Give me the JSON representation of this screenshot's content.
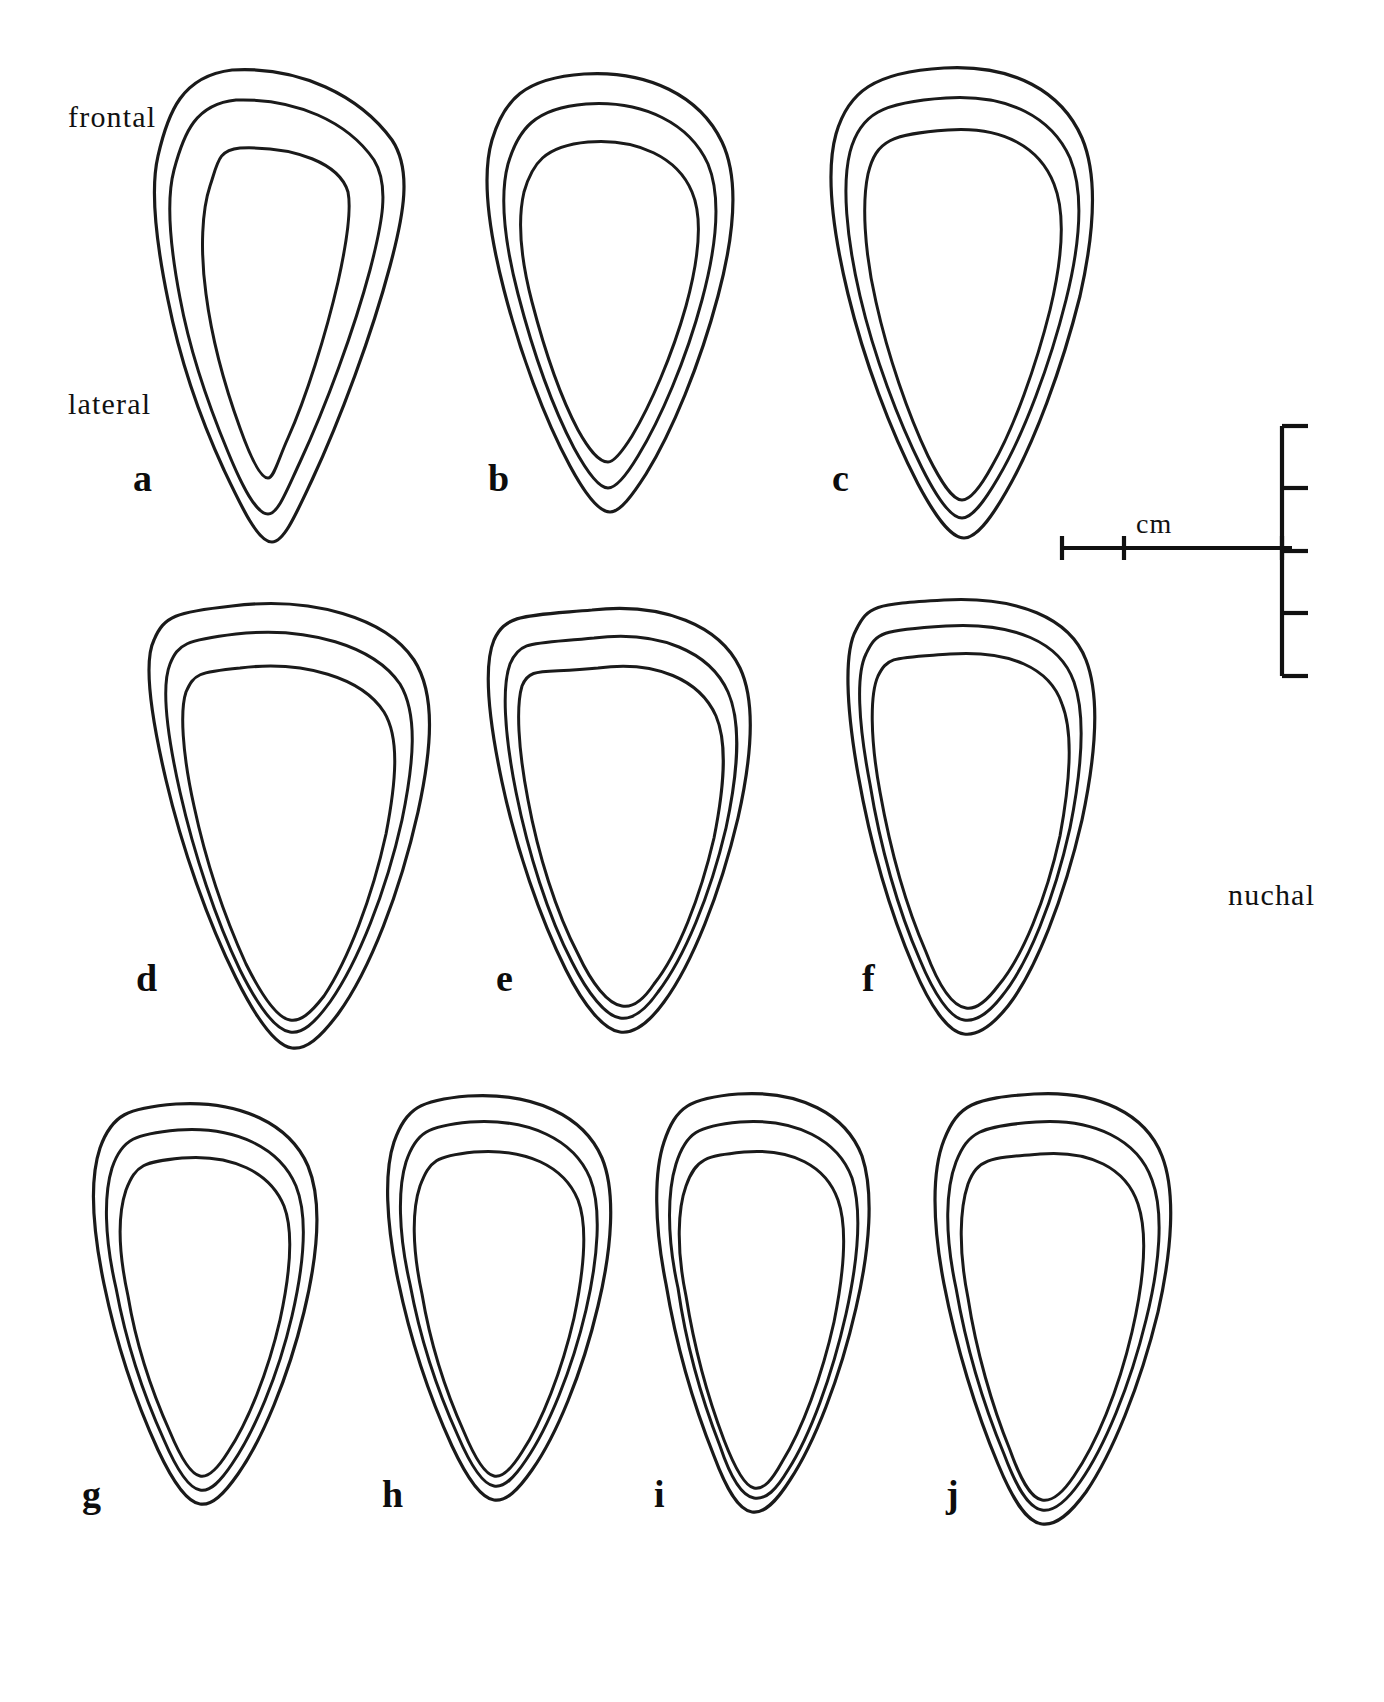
{
  "figure": {
    "type": "line-drawing",
    "background_color": "#ffffff",
    "line_color": "#1a1a1a"
  },
  "orientation_labels": [
    {
      "id": "frontal",
      "text": "frontal",
      "x": 68,
      "y": 100
    },
    {
      "id": "lateral",
      "text": "lateral",
      "x": 68,
      "y": 387
    },
    {
      "id": "nuchal",
      "text": "nuchal",
      "x": 1228,
      "y": 878
    }
  ],
  "scale_bar": {
    "unit_label": "cm",
    "unit_label_x": 1136,
    "unit_label_y": 508,
    "orientation": "cross",
    "vertical": {
      "x": 1282,
      "y_top": 426,
      "y_bottom": 676,
      "tick_length": 26,
      "ticks_y": [
        426,
        488,
        551,
        613,
        676
      ]
    },
    "horizontal": {
      "y": 548,
      "x_left": 1062,
      "x_right": 1292,
      "tick_height": 24,
      "ticks_x": [
        1062,
        1124,
        1282
      ]
    }
  },
  "panels": [
    {
      "label": "a",
      "label_x": 133,
      "label_y": 456,
      "row": 1,
      "col": 1
    },
    {
      "label": "b",
      "label_x": 488,
      "label_y": 456,
      "row": 1,
      "col": 2
    },
    {
      "label": "c",
      "label_x": 832,
      "label_y": 456,
      "row": 1,
      "col": 3
    },
    {
      "label": "d",
      "label_x": 136,
      "label_y": 956,
      "row": 2,
      "col": 1
    },
    {
      "label": "e",
      "label_x": 496,
      "label_y": 956,
      "row": 2,
      "col": 2
    },
    {
      "label": "f",
      "label_x": 862,
      "label_y": 956,
      "row": 2,
      "col": 3
    },
    {
      "label": "g",
      "label_x": 82,
      "label_y": 1472,
      "row": 3,
      "col": 1
    },
    {
      "label": "h",
      "label_x": 382,
      "label_y": 1472,
      "row": 3,
      "col": 2
    },
    {
      "label": "i",
      "label_x": 654,
      "label_y": 1472,
      "row": 3,
      "col": 3
    },
    {
      "label": "j",
      "label_x": 946,
      "label_y": 1472,
      "row": 3,
      "col": 4
    }
  ],
  "shapes": {
    "a": {
      "outer": "M 232 70 C 300 66 360 96 392 140 C 412 170 404 214 390 266 C 372 334 340 420 312 480 C 296 514 284 542 272 542 C 258 542 242 508 224 470 C 200 418 180 360 168 300 C 156 242 150 190 158 156 C 168 112 182 76 232 70 Z",
      "mid": "M 236 100 C 296 98 348 122 374 160 C 390 186 382 224 370 270 C 354 330 326 406 300 462 C 286 492 278 514 268 514 C 256 514 242 486 228 452 C 208 404 190 352 180 298 C 170 246 166 200 174 170 C 184 132 196 104 236 100 Z",
      "inner": "M 240 148 C 296 146 340 164 348 192 C 352 212 346 246 338 282 C 326 334 306 398 288 438 C 278 460 274 478 268 478 C 260 478 250 456 240 428 C 224 384 212 340 206 294 C 200 250 202 210 210 186 C 218 162 218 150 240 148 Z"
    },
    "b": {
      "outer": "M 584 74 C 648 70 700 96 722 142 C 740 180 734 236 718 296 C 700 364 672 432 646 474 C 632 496 620 512 610 512 C 598 512 584 492 570 466 C 544 418 520 352 504 290 C 488 228 482 174 492 140 C 504 100 524 78 584 74 Z",
      "mid": "M 586 104 C 644 100 690 124 708 164 C 722 198 716 248 702 300 C 686 360 660 420 638 456 C 626 476 616 488 608 488 C 598 488 586 470 574 448 C 552 406 532 348 518 294 C 504 240 500 194 508 164 C 518 130 534 108 586 104 Z",
      "inner": "M 588 142 C 638 138 678 158 692 192 C 704 220 698 262 686 306 C 672 356 650 406 632 436 C 622 452 614 462 608 462 C 598 462 588 448 578 430 C 560 396 544 348 532 302 C 520 256 518 218 524 192 C 532 164 544 146 588 142 Z"
    },
    "c": {
      "outer": "M 944 68 C 1014 64 1062 92 1082 138 C 1098 176 1094 234 1080 296 C 1062 368 1034 444 1006 492 C 990 520 976 538 964 538 C 950 538 934 514 918 484 C 890 430 864 360 848 294 C 832 228 826 170 836 134 C 848 92 874 72 944 68 Z",
      "mid": "M 946 98 C 1010 94 1052 118 1070 158 C 1084 192 1080 244 1066 300 C 1050 364 1024 434 998 478 C 984 502 972 518 962 518 C 950 518 936 496 922 468 C 898 420 874 356 860 296 C 846 236 842 184 850 152 C 860 114 882 102 946 98 Z",
      "inner": "M 948 130 C 1004 126 1040 148 1054 184 C 1066 214 1062 260 1050 310 C 1036 366 1014 428 992 466 C 980 488 970 500 962 500 C 952 500 940 480 928 456 C 908 414 888 356 876 302 C 864 250 862 202 868 174 C 876 140 892 134 948 130 Z"
    },
    "d": {
      "outer": "M 232 606 C 312 596 386 618 414 660 C 436 694 432 748 418 812 C 400 892 370 970 338 1014 C 320 1038 306 1050 292 1048 C 276 1046 256 1018 236 978 C 208 922 182 848 166 780 C 150 712 144 660 154 640 C 164 616 176 612 232 606 Z",
      "mid": "M 236 634 C 308 626 374 646 400 684 C 418 714 414 762 402 820 C 386 892 358 962 330 1002 C 314 1024 302 1034 290 1032 C 276 1030 258 1006 240 970 C 216 920 194 854 180 792 C 166 730 162 684 170 664 C 178 644 186 640 236 634 Z",
      "inner": "M 240 668 C 304 660 362 678 384 712 C 400 738 396 782 386 834 C 372 898 348 960 324 996 C 310 1014 300 1022 290 1020 C 278 1018 262 996 246 964 C 226 920 206 862 194 806 C 182 752 180 710 186 692 C 194 674 198 672 240 668 Z"
    },
    "e": {
      "outer": "M 592 610 C 664 602 720 626 740 668 C 756 702 752 756 738 818 C 720 894 692 964 664 1002 C 648 1024 634 1034 620 1032 C 604 1030 584 1006 566 970 C 540 918 516 848 502 782 C 488 716 484 664 494 640 C 506 614 524 616 592 610 Z",
      "mid": "M 594 638 C 660 630 710 652 728 692 C 742 724 738 772 726 828 C 710 896 684 958 658 992 C 644 1012 632 1020 620 1018 C 606 1016 588 994 572 962 C 548 916 528 852 516 792 C 504 732 502 686 510 664 C 520 640 532 644 594 638 Z",
      "inner": "M 598 668 C 656 660 700 680 716 716 C 728 744 724 788 714 838 C 700 898 678 954 654 984 C 642 1002 632 1008 622 1006 C 608 1004 592 984 578 954 C 556 912 538 854 528 800 C 518 748 516 706 522 686 C 530 666 542 674 598 668 Z"
    },
    "f": {
      "outer": "M 944 600 C 1018 596 1070 618 1086 660 C 1100 696 1096 754 1082 820 C 1064 898 1036 970 1008 1006 C 992 1026 978 1036 964 1034 C 948 1032 930 1006 914 968 C 890 912 870 842 858 774 C 846 706 844 652 856 630 C 868 606 874 604 944 600 Z",
      "mid": "M 946 626 C 1014 622 1060 642 1074 682 C 1086 716 1082 768 1070 828 C 1054 900 1028 964 1002 996 C 988 1014 976 1022 964 1020 C 950 1018 934 994 920 960 C 898 910 880 846 870 784 C 858 722 856 674 866 654 C 876 632 882 630 946 626 Z",
      "inner": "M 950 654 C 1010 650 1050 668 1062 704 C 1074 734 1070 782 1060 836 C 1046 900 1022 958 998 986 C 986 1002 976 1010 966 1008 C 952 1006 938 984 926 952 C 906 906 890 848 880 792 C 870 738 870 694 878 676 C 888 656 894 658 950 654 Z"
    },
    "g": {
      "outer": "M 176 1104 C 240 1100 290 1124 308 1166 C 322 1200 318 1254 304 1312 C 288 1378 262 1440 238 1474 C 224 1494 212 1506 200 1504 C 186 1502 172 1480 158 1450 C 136 1402 116 1342 104 1284 C 92 1226 90 1178 100 1148 C 112 1114 128 1108 176 1104 Z",
      "mid": "M 178 1130 C 236 1126 280 1148 296 1186 C 308 1216 304 1264 292 1316 C 278 1376 254 1432 232 1464 C 220 1482 210 1492 200 1490 C 188 1488 176 1468 164 1440 C 144 1396 126 1342 116 1288 C 104 1236 104 1194 112 1168 C 122 1138 136 1134 178 1130 Z",
      "inner": "M 182 1158 C 232 1154 270 1172 284 1206 C 294 1232 290 1274 280 1320 C 268 1372 248 1422 228 1452 C 218 1468 208 1478 200 1476 C 190 1474 180 1456 170 1432 C 152 1392 136 1344 128 1296 C 118 1250 118 1214 126 1190 C 136 1164 144 1162 182 1158 Z"
    },
    "h": {
      "outer": "M 468 1096 C 534 1092 584 1116 602 1158 C 616 1192 612 1248 598 1306 C 582 1374 556 1436 532 1470 C 518 1490 506 1502 494 1500 C 480 1498 466 1476 452 1446 C 430 1398 410 1338 398 1280 C 386 1222 384 1172 394 1142 C 406 1108 420 1100 468 1096 Z",
      "mid": "M 470 1122 C 530 1118 574 1140 590 1178 C 602 1208 598 1258 586 1310 C 572 1370 548 1428 526 1460 C 514 1478 504 1488 494 1486 C 482 1484 470 1464 458 1436 C 438 1392 420 1338 410 1284 C 398 1232 398 1188 406 1162 C 416 1132 428 1126 470 1122 Z",
      "inner": "M 474 1152 C 526 1148 564 1166 578 1200 C 588 1226 584 1270 574 1318 C 562 1370 542 1422 522 1452 C 512 1468 502 1478 494 1476 C 484 1474 474 1456 464 1432 C 446 1392 430 1342 422 1294 C 412 1248 412 1210 420 1186 C 430 1160 436 1156 474 1152 Z"
    },
    "i": {
      "outer": "M 738 1094 C 800 1090 846 1114 862 1156 C 874 1192 870 1248 856 1308 C 840 1378 814 1444 790 1480 C 776 1502 764 1514 752 1512 C 738 1510 726 1488 714 1456 C 694 1406 676 1344 666 1284 C 654 1224 654 1172 664 1142 C 676 1106 690 1098 738 1094 Z",
      "mid": "M 740 1122 C 796 1118 838 1140 852 1178 C 862 1210 858 1260 846 1314 C 832 1376 810 1436 788 1470 C 776 1490 766 1500 754 1498 C 742 1496 730 1476 720 1446 C 702 1400 686 1344 678 1288 C 666 1234 668 1190 676 1164 C 686 1132 698 1126 740 1122 Z",
      "inner": "M 744 1152 C 792 1148 826 1166 838 1200 C 848 1228 844 1272 834 1322 C 822 1376 802 1430 782 1462 C 772 1480 764 1490 754 1488 C 744 1486 734 1466 724 1440 C 708 1398 694 1346 686 1296 C 676 1248 678 1208 686 1186 C 696 1158 706 1156 744 1152 Z"
    },
    "j": {
      "outer": "M 1034 1094 C 1098 1090 1146 1114 1162 1156 C 1176 1192 1172 1250 1158 1312 C 1140 1386 1112 1454 1086 1492 C 1070 1514 1056 1526 1042 1524 C 1026 1522 1012 1498 998 1464 C 976 1412 956 1346 944 1284 C 932 1222 932 1170 944 1140 C 958 1104 974 1098 1034 1094 Z",
      "mid": "M 1036 1122 C 1094 1118 1138 1140 1152 1180 C 1164 1212 1160 1264 1146 1320 C 1130 1386 1104 1448 1080 1482 C 1066 1502 1054 1512 1042 1510 C 1028 1508 1016 1486 1004 1454 C 984 1406 966 1346 956 1288 C 944 1232 946 1188 956 1162 C 968 1132 980 1126 1036 1122 Z",
      "inner": "M 1040 1154 C 1090 1150 1126 1168 1138 1204 C 1148 1234 1144 1280 1132 1332 C 1118 1392 1096 1444 1074 1476 C 1062 1494 1052 1502 1042 1500 C 1030 1498 1020 1478 1010 1450 C 992 1406 976 1350 968 1298 C 958 1248 960 1208 968 1184 C 978 1158 990 1158 1040 1154 Z"
    }
  }
}
